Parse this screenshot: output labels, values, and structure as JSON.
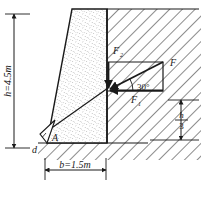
{
  "figure": {
    "labels": {
      "height_dim": "h=4.5m",
      "base_dim": "b=1.5m",
      "force_resultant": "F",
      "force_vertical": "F",
      "force_vertical_sub": "2",
      "force_horizontal": "F",
      "force_horizontal_sub": "1",
      "angle": "30°",
      "third_height_numerator": "h",
      "third_height_denominator": "3",
      "point_a": "A",
      "point_d": "d"
    },
    "colors": {
      "line": "#1a1a1a",
      "hatch": "#2b2b2b",
      "stipple": "#6b6b6b",
      "background": "#ffffff",
      "text": "#1a1a1a"
    },
    "geometry": {
      "wall_top_left_x": 72,
      "wall_top_y": 9,
      "wall_bottom_left_x": 47,
      "wall_bottom_y": 143,
      "wall_right_x": 107,
      "ground_y": 143,
      "dim_left_x": 14,
      "dim_height_top_y": 14,
      "dim_height_bottom_y": 148,
      "base_dim_y": 170,
      "force_point_x": 108,
      "force_point_y": 88,
      "parallelogram_right_x": 163,
      "parallelogram_top_y": 62,
      "angle_degrees": 30,
      "third_dim_x": 181,
      "third_dim_top_y": 100,
      "third_dim_bottom_y": 140
    }
  }
}
